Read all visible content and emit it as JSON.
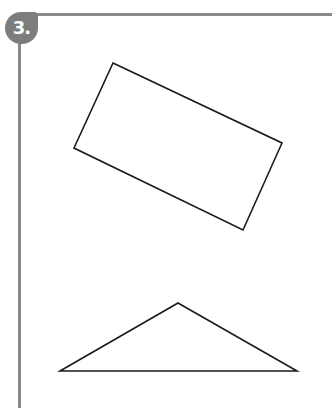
{
  "exercise": {
    "number_label": "3.",
    "colors": {
      "rule": "#8a8a8a",
      "badge": "#7d7d7d",
      "badge_text": "#ffffff",
      "shape_stroke": "#1a1a1a"
    }
  },
  "figures": [
    {
      "name": "rectangle",
      "type": "polygon",
      "points": "113,63 282,143 243,230 74,148"
    },
    {
      "name": "triangle",
      "type": "polygon",
      "points": "178,303 297,371 60,371"
    }
  ]
}
